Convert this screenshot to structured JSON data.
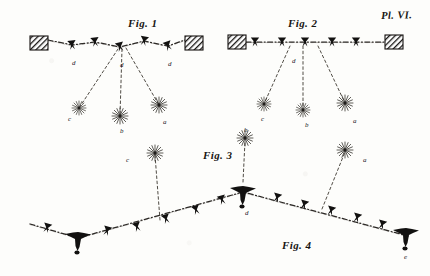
{
  "plate": {
    "number_label": "Pl. VI.",
    "background_color": "#fdfdfb",
    "ink_color": "#1a1816",
    "width": 430,
    "height": 276
  },
  "figures": [
    {
      "id": "fig1",
      "label": "Fig. 1",
      "label_x": 128,
      "label_y": 18,
      "description": "zig-zag suspended line anchored between two hatched wall blocks, with three descending dotted branches ending in burst symbols",
      "anchors": [
        {
          "name": "anchor-left",
          "x": 30,
          "y": 36,
          "width": 18,
          "height": 14
        },
        {
          "name": "anchor-right",
          "x": 185,
          "y": 36,
          "width": 18,
          "height": 14
        }
      ],
      "path_points": [
        {
          "x": 48,
          "y": 40
        },
        {
          "x": 72,
          "y": 45
        },
        {
          "x": 95,
          "y": 42
        },
        {
          "x": 120,
          "y": 47
        },
        {
          "x": 144,
          "y": 41
        },
        {
          "x": 168,
          "y": 46
        },
        {
          "x": 185,
          "y": 40
        }
      ],
      "markers": [
        {
          "name": "marker-arrow",
          "x": 72,
          "y": 45
        },
        {
          "name": "marker-arrow",
          "x": 95,
          "y": 42
        },
        {
          "name": "marker-arrow",
          "x": 120,
          "y": 47
        },
        {
          "name": "marker-arrow",
          "x": 144,
          "y": 41
        },
        {
          "name": "marker-arrow",
          "x": 168,
          "y": 46
        }
      ],
      "point_labels": [
        {
          "text": "d",
          "x": 72,
          "y": 60
        },
        {
          "text": "d",
          "x": 120,
          "y": 62
        },
        {
          "text": "d",
          "x": 168,
          "y": 61
        }
      ],
      "branches": [
        {
          "name": "branch-c",
          "from_x": 118,
          "from_y": 49,
          "to_x": 79,
          "to_y": 108,
          "burst": {
            "x": 79,
            "y": 108,
            "radius": 7
          },
          "label": "c",
          "label_x": 68,
          "label_y": 116
        },
        {
          "name": "branch-b",
          "from_x": 122,
          "from_y": 49,
          "to_x": 120,
          "to_y": 116,
          "burst": {
            "x": 120,
            "y": 116,
            "radius": 8
          },
          "label": "b",
          "label_x": 120,
          "label_y": 128
        },
        {
          "name": "branch-a",
          "from_x": 126,
          "from_y": 48,
          "to_x": 159,
          "to_y": 105,
          "burst": {
            "x": 159,
            "y": 105,
            "radius": 8
          },
          "label": "a",
          "label_x": 163,
          "label_y": 119
        }
      ]
    },
    {
      "id": "fig2",
      "label": "Fig. 2",
      "label_x": 288,
      "label_y": 18,
      "description": "straight horizontal suspended line anchored between two hatched wall blocks, with three descending dotted branches ending in burst symbols",
      "anchors": [
        {
          "name": "anchor-left",
          "x": 228,
          "y": 35,
          "width": 18,
          "height": 14
        },
        {
          "name": "anchor-right",
          "x": 385,
          "y": 35,
          "width": 18,
          "height": 14
        }
      ],
      "path_points": [
        {
          "x": 246,
          "y": 42
        },
        {
          "x": 385,
          "y": 42
        }
      ],
      "markers": [
        {
          "name": "marker-arrow",
          "x": 255,
          "y": 42
        },
        {
          "name": "marker-arrow",
          "x": 282,
          "y": 42
        },
        {
          "name": "marker-arrow",
          "x": 305,
          "y": 42
        },
        {
          "name": "marker-arrow",
          "x": 332,
          "y": 42
        },
        {
          "name": "marker-arrow",
          "x": 356,
          "y": 42
        }
      ],
      "point_labels": [
        {
          "text": "d",
          "x": 292,
          "y": 58
        }
      ],
      "branches": [
        {
          "name": "branch-c",
          "from_x": 290,
          "from_y": 46,
          "to_x": 264,
          "to_y": 104,
          "burst": {
            "x": 264,
            "y": 104,
            "radius": 7
          },
          "label": "c",
          "label_x": 261,
          "label_y": 116
        },
        {
          "name": "branch-b",
          "from_x": 303,
          "from_y": 46,
          "to_x": 303,
          "to_y": 110,
          "burst": {
            "x": 303,
            "y": 110,
            "radius": 7
          },
          "label": "b",
          "label_x": 305,
          "label_y": 122
        },
        {
          "name": "branch-a",
          "from_x": 318,
          "from_y": 46,
          "to_x": 345,
          "to_y": 103,
          "burst": {
            "x": 345,
            "y": 103,
            "radius": 8
          },
          "label": "a",
          "label_x": 353,
          "label_y": 118
        }
      ]
    },
    {
      "id": "fig3",
      "label": "Fig. 3",
      "label_x": 203,
      "label_y": 150,
      "description": "vertical dotted branch rising from the central knot of the lower line to a burst symbol",
      "branches": [
        {
          "name": "branch-b",
          "from_x": 243,
          "from_y": 182,
          "to_x": 245,
          "to_y": 141,
          "burst": {
            "x": 245,
            "y": 138,
            "radius": 8
          },
          "label": "b",
          "label_x": 244,
          "label_y": 127
        }
      ]
    },
    {
      "id": "fig4",
      "label": "Fig. 4",
      "label_x": 282,
      "label_y": 240,
      "description": "long shallow V-shaped dashed line with arrow markers, heavy knots at left bend and right end, and two rising dotted branches to burst symbols",
      "path_points": [
        {
          "x": 30,
          "y": 224
        },
        {
          "x": 78,
          "y": 238
        },
        {
          "x": 243,
          "y": 192
        },
        {
          "x": 408,
          "y": 236
        }
      ],
      "markers": [
        {
          "name": "marker-arrow",
          "x": 47,
          "y": 228
        },
        {
          "name": "marker-arrow",
          "x": 107,
          "y": 231
        },
        {
          "name": "marker-arrow",
          "x": 137,
          "y": 227
        },
        {
          "name": "marker-arrow",
          "x": 166,
          "y": 219
        },
        {
          "name": "marker-arrow",
          "x": 196,
          "y": 210
        },
        {
          "name": "marker-arrow",
          "x": 222,
          "y": 200
        },
        {
          "name": "marker-arrow",
          "x": 277,
          "y": 198
        },
        {
          "name": "marker-arrow",
          "x": 304,
          "y": 205
        },
        {
          "name": "marker-arrow",
          "x": 331,
          "y": 211
        },
        {
          "name": "marker-arrow",
          "x": 357,
          "y": 218
        },
        {
          "name": "marker-arrow",
          "x": 382,
          "y": 225
        }
      ],
      "knots": [
        {
          "name": "knot-left",
          "x": 78,
          "y": 238
        },
        {
          "name": "knot-center",
          "x": 243,
          "y": 192
        },
        {
          "name": "knot-right",
          "x": 406,
          "y": 234
        }
      ],
      "point_labels": [
        {
          "text": "d",
          "x": 245,
          "y": 210
        },
        {
          "text": "e",
          "x": 404,
          "y": 254
        }
      ],
      "branches": [
        {
          "name": "branch-c",
          "from_x": 160,
          "from_y": 220,
          "to_x": 155,
          "to_y": 155,
          "burst": {
            "x": 155,
            "y": 153,
            "radius": 8
          },
          "label": "c",
          "label_x": 126,
          "label_y": 157
        },
        {
          "name": "branch-a",
          "from_x": 322,
          "from_y": 209,
          "to_x": 345,
          "to_y": 152,
          "burst": {
            "x": 345,
            "y": 150,
            "radius": 8
          },
          "label": "a",
          "label_x": 363,
          "label_y": 157
        }
      ]
    }
  ]
}
